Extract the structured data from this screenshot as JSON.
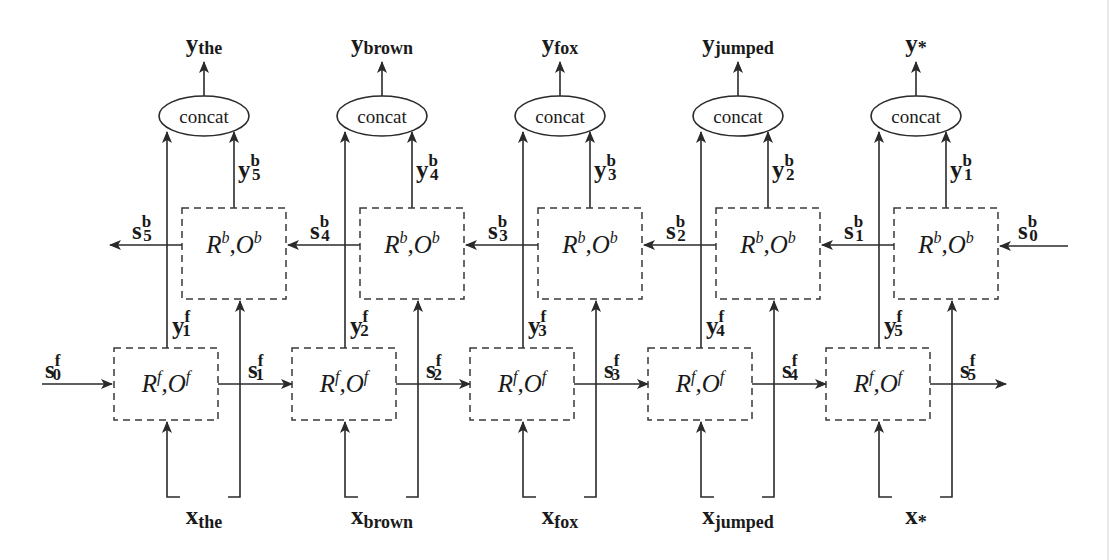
{
  "diagram": {
    "colors": {
      "stroke": "#2a2a2a",
      "text": "#1a1a1a",
      "background": "#ffffff"
    },
    "concat_label": "concat",
    "forward_cell": {
      "R": "R",
      "O": "O",
      "sup": "f"
    },
    "backward_cell": {
      "R": "R",
      "O": "O",
      "sup": "b"
    },
    "columns": [
      {
        "word": "the",
        "y_sub": "the",
        "x_sub": "the",
        "yf": "1",
        "yb": "5",
        "sf_out": "1",
        "sb_out": "5"
      },
      {
        "word": "brown",
        "y_sub": "brown",
        "x_sub": "brown",
        "yf": "2",
        "yb": "4",
        "sf_out": "2",
        "sb_out": "4"
      },
      {
        "word": "fox",
        "y_sub": "fox",
        "x_sub": "fox",
        "yf": "3",
        "yb": "3",
        "sf_out": "3",
        "sb_out": "3"
      },
      {
        "word": "jumped",
        "y_sub": "jumped",
        "x_sub": "jumped",
        "yf": "4",
        "yb": "2",
        "sf_out": "4",
        "sb_out": "2"
      },
      {
        "word": "*",
        "y_sub": "*",
        "x_sub": "*",
        "yf": "5",
        "yb": "1",
        "sf_out": "5",
        "sb_out": "1"
      }
    ],
    "initial_states": {
      "forward": {
        "base": "s",
        "sup": "f",
        "sub": "0"
      },
      "backward": {
        "base": "s",
        "sup": "b",
        "sub": "0"
      }
    },
    "symbols": {
      "y": "y",
      "x": "x",
      "s": "s",
      "comma": ","
    }
  }
}
